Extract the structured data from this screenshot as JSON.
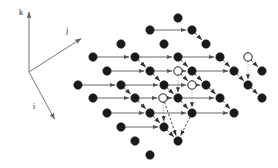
{
  "figure": {
    "background_color": "#ffffff",
    "node_fill_color": "#1a1a1a",
    "node_open_fill_color": "#ffffff",
    "node_stroke_color": "#1a1a1a",
    "solid_arrow_color": "#555555",
    "dashed_arrow_color": "#333333",
    "dotted_arrow_color": "#888888",
    "axis_color": "#666666",
    "node_radius": 4.2,
    "open_node_radius": 4.2,
    "width": 278,
    "height": 168
  },
  "axes": {
    "origin": {
      "x": 29,
      "y": 72
    },
    "items": [
      {
        "name": "k",
        "label": "k",
        "tip_x": 29,
        "tip_y": 11,
        "label_x": 19,
        "label_y": 15
      },
      {
        "name": "j",
        "label": "j",
        "tip_x": 82,
        "tip_y": 38,
        "label_x": 66,
        "label_y": 33
      },
      {
        "name": "i",
        "label": "i",
        "tip_x": 55,
        "tip_y": 120,
        "label_x": 33,
        "label_y": 109
      }
    ]
  },
  "lattice": {
    "nodes": [
      {
        "x": 178,
        "y": 18,
        "type": "filled"
      },
      {
        "x": 150,
        "y": 30,
        "type": "filled"
      },
      {
        "x": 192,
        "y": 30,
        "type": "filled"
      },
      {
        "x": 121,
        "y": 44,
        "type": "filled"
      },
      {
        "x": 164,
        "y": 44,
        "type": "filled"
      },
      {
        "x": 206,
        "y": 44,
        "type": "filled"
      },
      {
        "x": 93,
        "y": 57,
        "type": "filled"
      },
      {
        "x": 135,
        "y": 57,
        "type": "filled"
      },
      {
        "x": 178,
        "y": 57,
        "type": "filled"
      },
      {
        "x": 220,
        "y": 57,
        "type": "filled"
      },
      {
        "x": 248,
        "y": 57,
        "type": "open"
      },
      {
        "x": 107,
        "y": 71,
        "type": "filled"
      },
      {
        "x": 150,
        "y": 71,
        "type": "filled"
      },
      {
        "x": 178,
        "y": 71,
        "type": "open"
      },
      {
        "x": 192,
        "y": 71,
        "type": "filled"
      },
      {
        "x": 234,
        "y": 71,
        "type": "filled"
      },
      {
        "x": 262,
        "y": 71,
        "type": "filled"
      },
      {
        "x": 78,
        "y": 85,
        "type": "filled"
      },
      {
        "x": 121,
        "y": 85,
        "type": "filled"
      },
      {
        "x": 164,
        "y": 85,
        "type": "filled"
      },
      {
        "x": 192,
        "y": 85,
        "type": "open"
      },
      {
        "x": 206,
        "y": 85,
        "type": "filled"
      },
      {
        "x": 248,
        "y": 85,
        "type": "filled"
      },
      {
        "x": 93,
        "y": 98,
        "type": "filled"
      },
      {
        "x": 135,
        "y": 98,
        "type": "filled"
      },
      {
        "x": 163,
        "y": 98,
        "type": "open"
      },
      {
        "x": 178,
        "y": 98,
        "type": "filled"
      },
      {
        "x": 220,
        "y": 98,
        "type": "filled"
      },
      {
        "x": 262,
        "y": 98,
        "type": "filled"
      },
      {
        "x": 107,
        "y": 113,
        "type": "filled"
      },
      {
        "x": 150,
        "y": 113,
        "type": "filled"
      },
      {
        "x": 192,
        "y": 113,
        "type": "filled"
      },
      {
        "x": 234,
        "y": 113,
        "type": "filled"
      },
      {
        "x": 121,
        "y": 127,
        "type": "filled"
      },
      {
        "x": 164,
        "y": 127,
        "type": "filled"
      },
      {
        "x": 135,
        "y": 141,
        "type": "filled"
      },
      {
        "x": 178,
        "y": 141,
        "type": "filled"
      },
      {
        "x": 150,
        "y": 155,
        "type": "filled"
      }
    ],
    "solid_arrows": [
      {
        "x1": 150,
        "y1": 30,
        "x2": 192,
        "y2": 30
      },
      {
        "x1": 93,
        "y1": 57,
        "x2": 135,
        "y2": 57
      },
      {
        "x1": 135,
        "y1": 57,
        "x2": 178,
        "y2": 57
      },
      {
        "x1": 178,
        "y1": 57,
        "x2": 220,
        "y2": 57
      },
      {
        "x1": 107,
        "y1": 71,
        "x2": 150,
        "y2": 71
      },
      {
        "x1": 150,
        "y1": 71,
        "x2": 178,
        "y2": 71
      },
      {
        "x1": 178,
        "y1": 71,
        "x2": 192,
        "y2": 71
      },
      {
        "x1": 192,
        "y1": 71,
        "x2": 234,
        "y2": 71
      },
      {
        "x1": 78,
        "y1": 85,
        "x2": 121,
        "y2": 85
      },
      {
        "x1": 121,
        "y1": 85,
        "x2": 164,
        "y2": 85
      },
      {
        "x1": 164,
        "y1": 85,
        "x2": 192,
        "y2": 85
      },
      {
        "x1": 192,
        "y1": 85,
        "x2": 206,
        "y2": 85
      },
      {
        "x1": 93,
        "y1": 98,
        "x2": 135,
        "y2": 98
      },
      {
        "x1": 135,
        "y1": 98,
        "x2": 163,
        "y2": 98
      },
      {
        "x1": 163,
        "y1": 98,
        "x2": 178,
        "y2": 98
      },
      {
        "x1": 178,
        "y1": 98,
        "x2": 220,
        "y2": 98
      },
      {
        "x1": 107,
        "y1": 113,
        "x2": 150,
        "y2": 113
      },
      {
        "x1": 150,
        "y1": 113,
        "x2": 192,
        "y2": 113
      },
      {
        "x1": 192,
        "y1": 113,
        "x2": 234,
        "y2": 113
      },
      {
        "x1": 121,
        "y1": 127,
        "x2": 164,
        "y2": 127
      }
    ],
    "dashed_arrows": [
      {
        "x1": 192,
        "y1": 30,
        "x2": 206,
        "y2": 44
      },
      {
        "x1": 135,
        "y1": 57,
        "x2": 150,
        "y2": 71
      },
      {
        "x1": 178,
        "y1": 57,
        "x2": 192,
        "y2": 71
      },
      {
        "x1": 220,
        "y1": 57,
        "x2": 234,
        "y2": 71
      },
      {
        "x1": 248,
        "y1": 57,
        "x2": 262,
        "y2": 71
      },
      {
        "x1": 150,
        "y1": 71,
        "x2": 164,
        "y2": 85
      },
      {
        "x1": 178,
        "y1": 71,
        "x2": 192,
        "y2": 85
      },
      {
        "x1": 192,
        "y1": 71,
        "x2": 206,
        "y2": 85
      },
      {
        "x1": 234,
        "y1": 71,
        "x2": 248,
        "y2": 85
      },
      {
        "x1": 121,
        "y1": 85,
        "x2": 135,
        "y2": 98
      },
      {
        "x1": 164,
        "y1": 85,
        "x2": 178,
        "y2": 98
      },
      {
        "x1": 206,
        "y1": 85,
        "x2": 220,
        "y2": 98
      },
      {
        "x1": 248,
        "y1": 85,
        "x2": 262,
        "y2": 98
      },
      {
        "x1": 135,
        "y1": 98,
        "x2": 150,
        "y2": 113
      },
      {
        "x1": 178,
        "y1": 98,
        "x2": 192,
        "y2": 113
      },
      {
        "x1": 220,
        "y1": 98,
        "x2": 234,
        "y2": 113
      },
      {
        "x1": 150,
        "y1": 113,
        "x2": 164,
        "y2": 127
      },
      {
        "x1": 192,
        "y1": 113,
        "x2": 178,
        "y2": 141
      },
      {
        "x1": 164,
        "y1": 127,
        "x2": 178,
        "y2": 141
      },
      {
        "x1": 163,
        "y1": 98,
        "x2": 178,
        "y2": 141
      }
    ],
    "dotted_arrows": [
      {
        "x1": 178,
        "y1": 71,
        "x2": 178,
        "y2": 98
      },
      {
        "x1": 192,
        "y1": 85,
        "x2": 192,
        "y2": 113
      },
      {
        "x1": 163,
        "y1": 98,
        "x2": 164,
        "y2": 127
      },
      {
        "x1": 248,
        "y1": 57,
        "x2": 248,
        "y2": 85
      }
    ]
  },
  "counts": {
    "total_nodes": 38,
    "filled_nodes": 34,
    "open_nodes": 4,
    "solid_arrows": 20,
    "dashed_arrows": 20,
    "dotted_arrows": 4
  }
}
